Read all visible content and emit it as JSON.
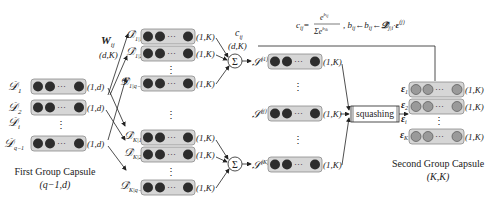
{
  "first_group": {
    "title": "First Group Capsule",
    "shape": "(q−1,d)",
    "rows": [
      {
        "label": "𝒟",
        "sub": "1",
        "dim": "(1,d)"
      },
      {
        "label": "𝒟",
        "sub": "2",
        "dim": "(1,d)"
      },
      {
        "label": "𝒟",
        "sub": "i",
        "dim": ""
      },
      {
        "label": "𝒟",
        "sub": "q−1",
        "dim": "(1,d)"
      }
    ]
  },
  "weights": {
    "label": "W",
    "sub": "ij",
    "shape": "(d,K)"
  },
  "prediction_top": {
    "rows": [
      {
        "label": "𝒟̂",
        "sub": "1|1",
        "dim": "(1,K)"
      },
      {
        "label": "𝒟̂",
        "sub": "1|2",
        "dim": "(1,K)"
      },
      {
        "label": "𝒟̂",
        "sub": "1|q−1",
        "dim": "(1,K)"
      }
    ]
  },
  "prediction_bottom": {
    "rows": [
      {
        "label": "𝒟̂",
        "sub": "K|1",
        "dim": "(1,K)"
      },
      {
        "label": "𝒟̂",
        "sub": "K|2",
        "dim": "(1,K)"
      },
      {
        "label": "𝒟̂",
        "sub": "K|q−1",
        "dim": "(1,K)"
      }
    ]
  },
  "sum_symbol": "Σ",
  "coupling": {
    "label": "c",
    "sub": "ij",
    "shape": "(d,K)"
  },
  "formula": "c_ij = e^{b_ij} / Σ e^{b_ik} ,  b_ij ← b_ij ← 𝒟̂_{j|i} · ε_i^{(j)}",
  "weighted_sums": [
    {
      "label": "𝒮",
      "sub": "ij",
      "sup": "(1)",
      "dim": "(1,K)"
    },
    {
      "label": "𝒮",
      "sub": "ij",
      "sup": "(j)",
      "dim": "(1,K)"
    },
    {
      "label": "𝒮",
      "sub": "ij",
      "sup": "(K)",
      "dim": "(1,K)"
    }
  ],
  "squashing_label": "squashing",
  "second_group": {
    "title": "Second Group Capsule",
    "shape": "(K,K)",
    "rows": [
      {
        "label": "ε",
        "sub": "1",
        "dim": "(1,K)"
      },
      {
        "label": "ε",
        "sub": "2",
        "dim": "(1,K)"
      },
      {
        "label": "ε",
        "sub": "i",
        "dim": ""
      },
      {
        "label": "ε",
        "sub": "K",
        "dim": "(1,K)"
      }
    ]
  },
  "ellipsis": "···",
  "vdots": "⋮"
}
